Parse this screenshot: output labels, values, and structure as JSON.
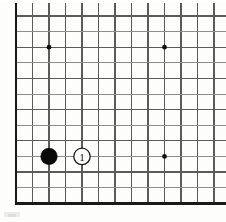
{
  "diagram": {
    "board_type": "go-board",
    "visible_columns": 13,
    "visible_rows": 13,
    "line_color": "#5b5b5b",
    "faint_line_color": "#8e8e8e",
    "border_color": "#1a1a1a",
    "background_color": "#fdfdfc",
    "grid": {
      "origin_x": 16,
      "origin_y": 16,
      "spacing_x": 16.5,
      "spacing_y": 15.6,
      "cols": 13,
      "rows": 13
    },
    "borders": [
      {
        "name": "left-border",
        "thick": true
      },
      {
        "name": "bottom-border",
        "thick": true
      }
    ],
    "star_points": [
      {
        "name": "star-point-upper-left",
        "col": 2,
        "row": 2,
        "radius": 2.4
      },
      {
        "name": "star-point-upper-right",
        "col": 9,
        "row": 2,
        "radius": 2.4
      },
      {
        "name": "star-point-lower-right",
        "col": 9,
        "row": 9,
        "radius": 2.4
      }
    ],
    "stones": [
      {
        "name": "black-stone",
        "color": "black",
        "col": 2,
        "row": 9,
        "radius": 8.2,
        "label": ""
      },
      {
        "name": "white-stone-move-1",
        "color": "white",
        "col": 4,
        "row": 9,
        "radius": 8.2,
        "label": "1"
      }
    ],
    "move_numbers": [
      "1"
    ],
    "artifacts": [
      {
        "name": "scan-smudge",
        "description": "faint grey scan artifact below board"
      }
    ]
  }
}
